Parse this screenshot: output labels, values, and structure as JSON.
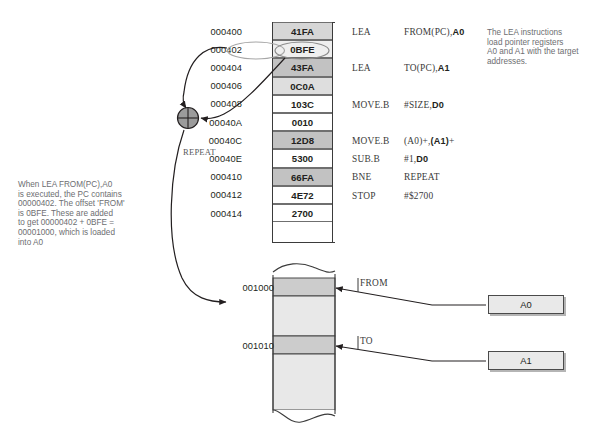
{
  "notes": {
    "left": "When LEA  FROM(PC),A0\nis executed, the PC contains\n00000402. The offset 'FROM'\nis 0BFE. These are added\nto get 00000402 + 0BFE =\n00001000, which is loaded\ninto A0",
    "right": "The LEA instructions\nload pointer registers\nA0 and A1 with the target\naddresses."
  },
  "code_listing": {
    "label_repeat": "REPEAT",
    "rows": [
      {
        "address": "000400",
        "code": "41FA",
        "shade": "#d6d6d6",
        "instruction": "LEA",
        "operand_prefix": "FROM(PC),",
        "operand_bold": "A0"
      },
      {
        "address": "000402",
        "code": "0BFE",
        "shade": "#efefef",
        "instruction": "",
        "operand_prefix": "",
        "operand_bold": ""
      },
      {
        "address": "000404",
        "code": "43FA",
        "shade": "#c2c2c2",
        "instruction": "LEA",
        "operand_prefix": "TO(PC),",
        "operand_bold": "A1"
      },
      {
        "address": "000406",
        "code": "0C0A",
        "shade": "#dedede",
        "instruction": "",
        "operand_prefix": "",
        "operand_bold": ""
      },
      {
        "address": "000408",
        "code": "103C",
        "shade": "#ffffff",
        "instruction": "MOVE.B",
        "operand_prefix": "#SIZE,",
        "operand_bold": "D0"
      },
      {
        "address": "00040A",
        "code": "0010",
        "shade": "#ffffff",
        "instruction": "",
        "operand_prefix": "",
        "operand_bold": ""
      },
      {
        "address": "00040C",
        "code": "12D8",
        "shade": "#c2c2c2",
        "instruction": "MOVE.B",
        "operand_prefix": "(A0)+,",
        "operand_bold": "(A1)",
        "operand_suffix": "+"
      },
      {
        "address": "00040E",
        "code": "5300",
        "shade": "#ffffff",
        "instruction": "SUB.B",
        "operand_prefix": "#1,",
        "operand_bold": "D0"
      },
      {
        "address": "000410",
        "code": "66FA",
        "shade": "#c2c2c2",
        "instruction": "BNE",
        "operand_prefix": "REPEAT",
        "operand_bold": ""
      },
      {
        "address": "000412",
        "code": "4E72",
        "shade": "#ffffff",
        "instruction": "STOP",
        "operand_prefix": "#$2700",
        "operand_bold": ""
      },
      {
        "address": "000414",
        "code": "2700",
        "shade": "#ffffff",
        "instruction": "",
        "operand_prefix": "",
        "operand_bold": ""
      }
    ],
    "highlighted_address": "000402",
    "highlighted_code": "0BFE"
  },
  "memory": {
    "rows": [
      {
        "address": "001000",
        "label": "FROM",
        "shade": "#cccccc"
      },
      {
        "address": "",
        "label": "",
        "shade": "#e8e8e8"
      },
      {
        "address": "001010",
        "label": "TO",
        "shade": "#cccccc"
      },
      {
        "address": "",
        "label": "",
        "shade": "#e8e8e8"
      }
    ],
    "top_address": "001000",
    "bottom_address": "001010",
    "label_from": "FROM",
    "label_to": "TO"
  },
  "registers": [
    {
      "name": "A0"
    },
    {
      "name": "A1"
    }
  ],
  "adder": {
    "symbol": "plus-in-circle"
  },
  "colors": {
    "ink": "#231f20",
    "note_gray": "#6d6e71",
    "rule": "#3b3b3b",
    "adder_fill": "#9b9b9b",
    "register_fill": "#e9e9e9",
    "mem_band_dark": "#cccccc",
    "mem_band_light": "#e8e8e8"
  }
}
